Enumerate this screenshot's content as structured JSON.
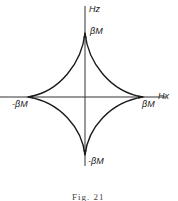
{
  "diagram": {
    "type": "astroid (Stoner-Wohlfarth switching curve)",
    "axes": {
      "vertical_label": "Hz",
      "horizontal_label": "Hx"
    },
    "cusp_labels": {
      "top": "βM",
      "right": "βM",
      "left": "-βM",
      "bottom": "-βM"
    },
    "caption": "Fig. 21",
    "colors": {
      "line": "#1a1a1a",
      "background": "#ffffff"
    }
  }
}
